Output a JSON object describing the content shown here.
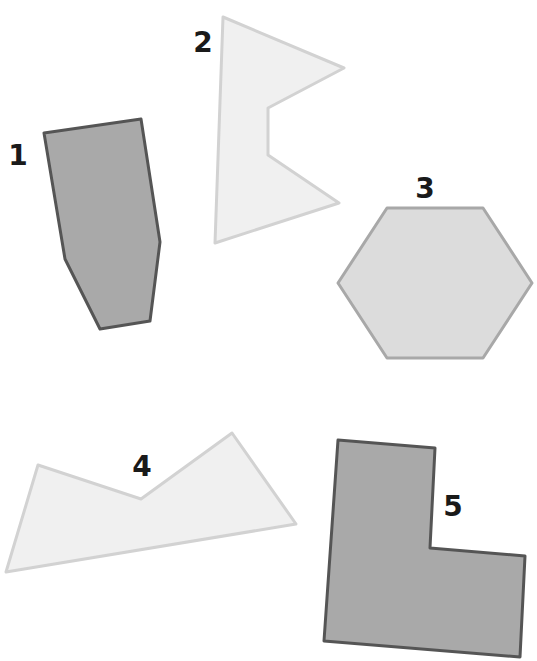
{
  "canvas": {
    "width": 537,
    "height": 661,
    "background": "#ffffff"
  },
  "colors": {
    "dark_fill": "#a9a9a9",
    "dark_stroke": "#555555",
    "light_fill": "#f0f0f0",
    "light_stroke": "#d2d2d2",
    "mid_fill": "#dcdcdc",
    "mid_stroke": "#a8a8a8",
    "label": "#1a1a1a"
  },
  "shapes": [
    {
      "id": "1",
      "label": "1",
      "kind": "irregular hexagon",
      "shade": "dark",
      "points": "44,133 141,119 160,242 150,321 100,329 65,259",
      "label_pos": [
        18,
        165
      ]
    },
    {
      "id": "2",
      "label": "2",
      "kind": "concave hexagon (flag)",
      "shade": "light",
      "points": "223,17 344,68 268,108 268,155 339,203 215,243",
      "label_pos": [
        203,
        52
      ]
    },
    {
      "id": "3",
      "label": "3",
      "kind": "regular hexagon",
      "shade": "mid",
      "points": "387,208 483,208 532,283 483,358 387,358 338,283",
      "label_pos": [
        425,
        198
      ]
    },
    {
      "id": "4",
      "label": "4",
      "kind": "concave pentagon",
      "shade": "light",
      "points": "38,465 141,499 232,433 296,524 6,572",
      "label_pos": [
        142,
        476
      ]
    },
    {
      "id": "5",
      "label": "5",
      "kind": "L-shaped hexagon",
      "shade": "dark",
      "points": "338,440 435,448 430,548 525,556 520,657 324,641",
      "label_pos": [
        453,
        516
      ]
    }
  ]
}
